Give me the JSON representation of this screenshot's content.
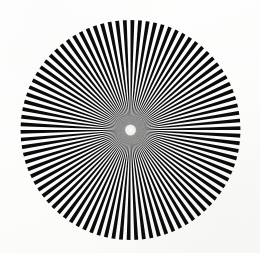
{
  "figure": {
    "kind": "siemens-star",
    "background_color": "#fdfdfc",
    "spoke_color": "#0b0b0b",
    "gap_color": "#fdfdfc",
    "hub_color": "#f6f5f2",
    "haze_color": "#8e8e8e",
    "width": 260,
    "height": 253
  },
  "chart_data": {
    "type": "pie",
    "subtitle": "",
    "xlabel": "",
    "ylabel": "",
    "center_x": 130.5,
    "center_y": 130.0,
    "outer_radius": 110,
    "hub_radius": 5.5,
    "haze_radius": 26,
    "sector_count": 180,
    "spoke_count": 90,
    "sector_angle_degrees": 2,
    "start_angle_degrees": 0,
    "categories": [
      "black wedge",
      "white wedge"
    ],
    "values": [
      90,
      90
    ],
    "legend": [],
    "grid": false,
    "annotations": []
  }
}
